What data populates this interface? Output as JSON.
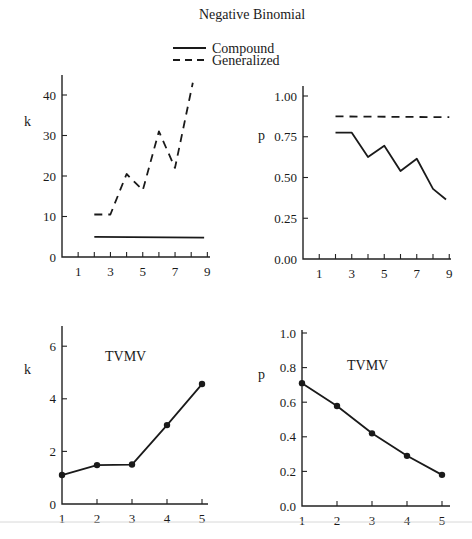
{
  "title": "Negative Binomial",
  "legend": {
    "items": [
      {
        "label": "Compound",
        "style": "solid"
      },
      {
        "label": "Generalized",
        "style": "dashed"
      }
    ]
  },
  "chart_data": [
    {
      "id": "top-left",
      "type": "line",
      "ylabel": "k",
      "xlabel": "",
      "xlim": [
        0,
        9.2
      ],
      "ylim": [
        0,
        45
      ],
      "xticks": [
        1,
        2,
        3,
        4,
        5,
        6,
        7,
        8,
        9
      ],
      "xtick_labels": [
        "1",
        "",
        "3",
        "",
        "5",
        "",
        "7",
        "",
        "9"
      ],
      "yticks": [
        0,
        10,
        20,
        30,
        40
      ],
      "ytick_labels": [
        "0",
        "10",
        "20",
        "30",
        "40"
      ],
      "series": [
        {
          "name": "Compound",
          "style": "solid",
          "x": [
            2,
            8.8
          ],
          "y": [
            5,
            4.8
          ]
        },
        {
          "name": "Generalized",
          "style": "dashed",
          "x": [
            2,
            3,
            4,
            5,
            6,
            7,
            8.1
          ],
          "y": [
            10.5,
            10.5,
            20.5,
            16.5,
            31,
            22,
            43
          ]
        }
      ],
      "box": {
        "x0": 62,
        "y0": 257,
        "px_per_x": 16.15,
        "px_per_y": 4.05,
        "ytop": 75,
        "xend": 210
      }
    },
    {
      "id": "top-right",
      "type": "line",
      "ylabel": "p",
      "xlabel": "",
      "xlim": [
        0,
        9.2
      ],
      "ylim": [
        0,
        1.05
      ],
      "xticks": [
        1,
        2,
        3,
        4,
        5,
        6,
        7,
        8,
        9
      ],
      "xtick_labels": [
        "1",
        "",
        "3",
        "",
        "5",
        "",
        "7",
        "",
        "9"
      ],
      "yticks": [
        0,
        0.25,
        0.5,
        0.75,
        1.0
      ],
      "ytick_labels": [
        "0.00",
        "0.25",
        "0.50",
        "0.75",
        "1.00"
      ],
      "series": [
        {
          "name": "Compound",
          "style": "solid",
          "x": [
            2,
            3,
            4,
            5,
            6,
            7,
            8,
            8.8
          ],
          "y": [
            0.775,
            0.775,
            0.625,
            0.695,
            0.54,
            0.615,
            0.43,
            0.365
          ]
        },
        {
          "name": "Generalized",
          "style": "dashed",
          "x": [
            2,
            9
          ],
          "y": [
            0.875,
            0.87
          ]
        }
      ],
      "box": {
        "x0": 303,
        "y0": 259,
        "px_per_x": 16.25,
        "px_per_y": 163,
        "ytop": 86,
        "xend": 451
      }
    },
    {
      "id": "bottom-left",
      "type": "line",
      "annotation": "TVMV",
      "ylabel": "k",
      "xlabel": "",
      "xlim": [
        1,
        5.3
      ],
      "ylim": [
        0,
        6.8
      ],
      "xticks": [
        1,
        2,
        3,
        4,
        5
      ],
      "xtick_labels": [
        "1",
        "2",
        "3",
        "4",
        "5"
      ],
      "yticks": [
        0,
        2,
        4,
        6
      ],
      "ytick_labels": [
        "0",
        "2",
        "4",
        "6"
      ],
      "series": [
        {
          "name": "TVMV",
          "style": "solid-markers",
          "x": [
            1,
            2,
            3,
            4,
            5
          ],
          "y": [
            1.1,
            1.48,
            1.5,
            3.0,
            4.56
          ]
        }
      ],
      "box": {
        "x0": 62,
        "y0": 504,
        "px_per_x": 35.0,
        "px_per_y": 26.3,
        "ytop": 326,
        "xend": 208,
        "x_origin_value": 1
      }
    },
    {
      "id": "bottom-right",
      "type": "line",
      "annotation": "TVMV",
      "ylabel": "p",
      "xlabel": "",
      "xlim": [
        1,
        5.3
      ],
      "ylim": [
        0,
        1.0
      ],
      "xticks": [
        1,
        2,
        3,
        4,
        5
      ],
      "xtick_labels": [
        "1",
        "2",
        "3",
        "4",
        "5"
      ],
      "yticks": [
        0,
        0.2,
        0.4,
        0.6,
        0.8,
        1.0
      ],
      "ytick_labels": [
        "0.0",
        "0.2",
        "0.4",
        "0.6",
        "0.8",
        "1.0"
      ],
      "series": [
        {
          "name": "TVMV",
          "style": "solid-markers",
          "x": [
            1,
            2,
            3,
            4,
            5
          ],
          "y": [
            0.71,
            0.578,
            0.42,
            0.29,
            0.18
          ]
        }
      ],
      "box": {
        "x0": 302,
        "y0": 506,
        "px_per_x": 35.0,
        "px_per_y": 173,
        "ytop": 330,
        "xend": 450,
        "x_origin_value": 1
      }
    }
  ],
  "colors": {
    "ink": "#1a1a1a",
    "background": "#ffffff"
  }
}
